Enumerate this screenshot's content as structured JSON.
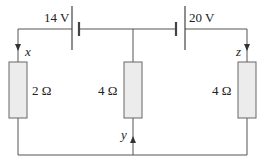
{
  "batteries": [
    {
      "label": "14 V"
    },
    {
      "label": "20 V"
    }
  ],
  "resistors": [
    {
      "label": "2 Ω"
    },
    {
      "label": "4 Ω"
    },
    {
      "label": "4 Ω"
    }
  ],
  "currents": [
    {
      "label": "x"
    },
    {
      "label": "y"
    },
    {
      "label": "z"
    }
  ],
  "colors": {
    "wire": "#555555",
    "resistor_fill": "#ececec",
    "resistor_stroke": "#666666"
  }
}
